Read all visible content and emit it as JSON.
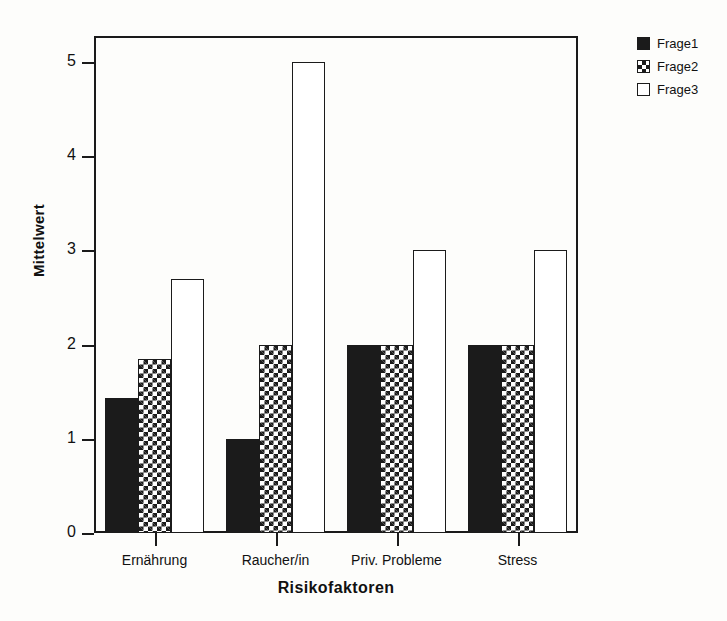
{
  "chart_data": {
    "type": "bar",
    "title": "",
    "xlabel": "Risikofaktoren",
    "ylabel": "Mittelwert",
    "categories": [
      "Ernährung",
      "Raucher/in",
      "Priv. Probleme",
      "Stress"
    ],
    "series": [
      {
        "name": "Frage1",
        "values": [
          1.43,
          1.0,
          2.0,
          2.0
        ],
        "style": "solid-black",
        "color": "#1b1b1b"
      },
      {
        "name": "Frage2",
        "values": [
          1.85,
          2.0,
          2.0,
          2.0
        ],
        "style": "checkerboard",
        "color": "#1b1b1b"
      },
      {
        "name": "Frage3",
        "values": [
          2.7,
          5.0,
          3.0,
          3.0
        ],
        "style": "white-outline",
        "color": "#ffffff"
      }
    ],
    "ylim": [
      0,
      5
    ],
    "yticks": [
      0,
      1,
      2,
      3,
      4,
      5
    ],
    "ytick_labels": [
      "0",
      "1",
      "2",
      "3",
      "4",
      "5"
    ],
    "grid": false,
    "legend_position": "top-right",
    "legend_entries": [
      "Frage1",
      "Frage2",
      "Frage3"
    ]
  },
  "axes": {
    "y_title": "Mittelwert",
    "x_title": "Risikofaktoren"
  },
  "colors": {
    "ink": "#1b1b1b",
    "background": "#fdfdfb"
  }
}
